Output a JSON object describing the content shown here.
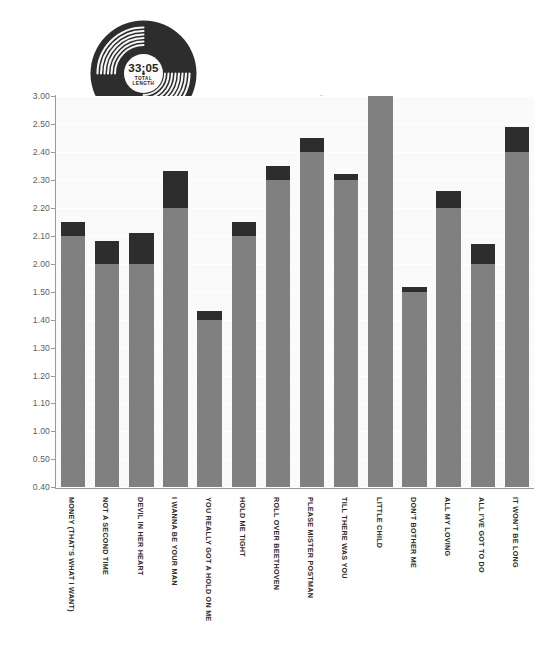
{
  "record": {
    "total_time": "33:05",
    "total_label_line1": "TOTAL",
    "total_label_line2": "LENGTH",
    "icon": "vinyl-record-icon"
  },
  "colors": {
    "minutes": "#808080",
    "seconds": "#2d2d2d",
    "plot_background": "#fafafa",
    "gridline": "#ffffff",
    "axis": "#9a9a9a",
    "tick_text": "#5e5e5e",
    "label_text": "#2b2b2b"
  },
  "chart_data": {
    "type": "bar",
    "title": "",
    "subtitle": "",
    "xlabel": "",
    "ylabel": "",
    "stacked": true,
    "grid": true,
    "legend": "none",
    "ytick_labels": [
      "3.00",
      "2.50",
      "2.40",
      "2.30",
      "2.20",
      "2.10",
      "2.00",
      "1.50",
      "1.40",
      "1.30",
      "1.20",
      "1.10",
      "1.00",
      "0.50",
      "0.40"
    ],
    "categories": [
      "MONEY (THAT'S WHAT I WANT)",
      "NOT A SECOND TIME",
      "DEVIL IN HER HEART",
      "I WANNA BE YOUR MAN",
      "YOU REALLY GOT A HOLD ON ME",
      "HOLD ME TIGHT",
      "ROLL OVER BEETHOVEN",
      "PLEASE MISTER POSTMAN",
      "TILL THERE WAS YOU",
      "LITTLE CHILD",
      "DON'T BOTHER ME",
      "ALL MY LOVING",
      "ALL I'VE GOT TO DO",
      "IT WON'T BE LONG"
    ],
    "series": [
      {
        "name": "minutes",
        "values": [
          2.1,
          2.0,
          2.0,
          2.2,
          1.4,
          2.1,
          2.3,
          2.4,
          2.3,
          3.0,
          1.5,
          2.2,
          2.0,
          2.4
        ]
      },
      {
        "name": "seconds",
        "values": [
          0.05,
          0.08,
          0.11,
          0.13,
          0.03,
          0.05,
          0.05,
          0.05,
          0.02,
          0.0,
          0.09,
          0.06,
          0.07,
          0.09
        ]
      }
    ],
    "totals": [
      2.15,
      2.08,
      2.11,
      2.33,
      1.43,
      2.15,
      2.35,
      2.45,
      2.32,
      3.0,
      1.59,
      2.26,
      2.07,
      2.49
    ],
    "ylim": [
      0.4,
      3.0
    ]
  }
}
